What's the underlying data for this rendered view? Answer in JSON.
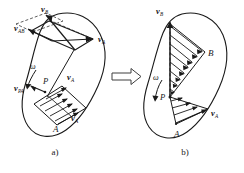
{
  "figure": {
    "implication_symbol": "⟹",
    "panels": [
      {
        "id": "a",
        "caption": "a)",
        "description": "Rigid body with velocity of point A, relative velocity of B with respect to A, and resulting velocity of B",
        "labels": [
          {
            "name": "v-b",
            "base": "v",
            "sub": "B",
            "x": 41,
            "y": 12
          },
          {
            "name": "v-ab",
            "base": "v",
            "sub": "AB",
            "x": 14,
            "y": 31
          },
          {
            "name": "v-a-top",
            "base": "v",
            "sub": "A",
            "x": 98,
            "y": 42
          },
          {
            "name": "omega",
            "base": "ω",
            "sub": "",
            "x": 30,
            "y": 69
          },
          {
            "name": "point-p",
            "base": "P",
            "sub": "",
            "x": 43,
            "y": 84
          },
          {
            "name": "v-pa",
            "base": "v",
            "sub": "PA",
            "x": 22,
            "y": 89
          },
          {
            "name": "v-a-mid",
            "base": "v",
            "sub": "A",
            "x": 67,
            "y": 80
          },
          {
            "name": "v-a-low",
            "base": "v",
            "sub": "A",
            "x": 71,
            "y": 117
          },
          {
            "name": "point-a",
            "base": "A",
            "sub": "",
            "x": 53,
            "y": 128
          }
        ]
      },
      {
        "id": "b",
        "caption": "b)",
        "description": "Same body showing the linear velocity profile fanning out from the instantaneous centre P toward A and B",
        "labels": [
          {
            "name": "v-b",
            "base": "v",
            "sub": "B",
            "x": 163,
            "y": 14
          },
          {
            "name": "point-b",
            "base": "B",
            "sub": "",
            "x": 208,
            "y": 53
          },
          {
            "name": "omega",
            "base": "ω",
            "sub": "",
            "x": 155,
            "y": 79
          },
          {
            "name": "point-p",
            "base": "P",
            "sub": "",
            "x": 160,
            "y": 97
          },
          {
            "name": "v-a",
            "base": "v",
            "sub": "A",
            "x": 213,
            "y": 113
          },
          {
            "name": "point-a",
            "base": "A",
            "sub": "",
            "x": 176,
            "y": 134
          }
        ]
      }
    ],
    "colors": {
      "ink": "#1a1a1a",
      "paper": "#ffffff",
      "faint": "#6a6a6a"
    }
  }
}
